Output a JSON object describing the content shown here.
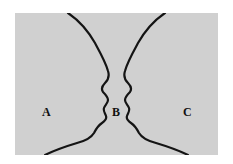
{
  "figure": {
    "kind": "rubin-face-vase-ambiguous-figure",
    "background_color": "#ffffff",
    "panel_color": "#d0d0d0",
    "stroke_color": "#141414",
    "panel": {
      "x": 15,
      "y": 13,
      "width": 203,
      "height": 142
    },
    "regions": [
      {
        "id": "a",
        "label": "A",
        "description": "left background region",
        "x": 27,
        "y": 93
      },
      {
        "id": "b",
        "label": "B",
        "description": "central region between the two profiles",
        "x": 97,
        "y": 93
      },
      {
        "id": "c",
        "label": "C",
        "description": "right background region",
        "x": 168,
        "y": 93
      }
    ],
    "contours": [
      {
        "id": "left-profile",
        "name": "left-facing-profile-contour",
        "path": "M 53,0 C 62,6 72,16 80,30 C 86,41 91,50 93,58 C 95,64 93,67 90,70 C 87,73 86,76 88,79 C 91,82 93,84 93,87 C 93,90 90,92 89,95 C 88,98 90,100 91,103 C 92,106 90,108 87,110 C 84,112 81,116 79,120 C 76,125 70,128 62,130 C 52,133 40,137 30,142"
      },
      {
        "id": "right-profile",
        "name": "right-facing-profile-contour",
        "path": "M 150,0 C 141,6 131,16 123,30 C 117,41 112,50 110,58 C 108,64 110,67 113,70 C 116,73 117,76 115,79 C 112,82 110,84 110,87 C 110,90 113,92 114,95 C 115,98 113,100 112,103 C 111,106 113,108 116,110 C 119,112 122,116 124,120 C 127,125 133,128 141,130 C 151,133 163,137 173,142"
      }
    ]
  }
}
